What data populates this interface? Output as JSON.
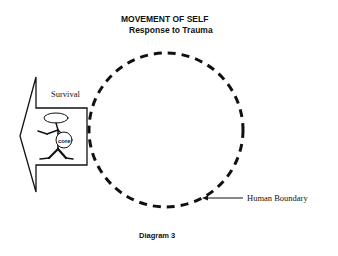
{
  "title": {
    "line1": "MOVEMENT OF SELF",
    "line2": "Response to Trauma"
  },
  "labels": {
    "survival": "Survival",
    "core": "core",
    "human_boundary": "Human Boundary"
  },
  "caption": "Diagram 3",
  "colors": {
    "ink": "#111111",
    "background": "#ffffff"
  }
}
